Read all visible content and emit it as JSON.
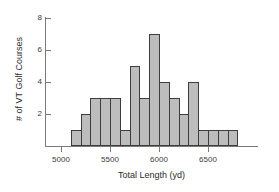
{
  "chart_data": {
    "type": "bar",
    "title": "",
    "subtitle": "",
    "xlabel": "Total Length (yd)",
    "ylabel": "# of VT Golf Courses",
    "xlim": [
      4900,
      6850
    ],
    "ylim": [
      0,
      8
    ],
    "grid": false,
    "legend": null,
    "bin_width": 100,
    "x_ticks": [
      5000,
      5500,
      6000,
      6500
    ],
    "x_tick_labels": [
      "5000",
      "5500",
      "6000",
      "6500"
    ],
    "y_ticks": [
      2,
      4,
      6,
      8
    ],
    "y_tick_labels": [
      "2",
      "4",
      "6",
      "8"
    ],
    "bin_starts": [
      5100,
      5200,
      5300,
      5400,
      5500,
      5600,
      5700,
      5800,
      5900,
      6000,
      6100,
      6200,
      6300,
      6400,
      6500,
      6600,
      6700
    ],
    "bin_ends": [
      5200,
      5300,
      5400,
      5500,
      5600,
      5700,
      5800,
      5900,
      6000,
      6100,
      6200,
      6300,
      6400,
      6500,
      6600,
      6700,
      6800
    ],
    "categories": [
      "5100-5200",
      "5200-5300",
      "5300-5400",
      "5400-5500",
      "5500-5600",
      "5600-5700",
      "5700-5800",
      "5800-5900",
      "5900-6000",
      "6000-6100",
      "6100-6200",
      "6200-6300",
      "6300-6400",
      "6400-6500",
      "6500-6600",
      "6600-6700",
      "6700-6800"
    ],
    "values": [
      1,
      2,
      3,
      3,
      3,
      1,
      5,
      3,
      7,
      4,
      3,
      2,
      4,
      1,
      1,
      1,
      1
    ],
    "colors": {
      "bar_fill": "#bdbdbd",
      "bar_edge": "#3d3d3d",
      "axis": "#7a7a7a",
      "text": "#2b2b2b",
      "background": "#ffffff"
    }
  }
}
